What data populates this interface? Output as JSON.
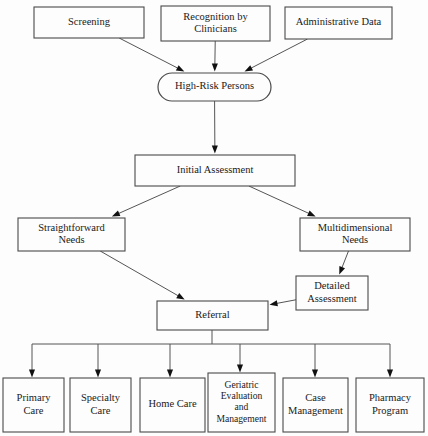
{
  "chart_data": {
    "type": "diagram",
    "diagram_type": "flowchart",
    "orientation": "top-to-bottom",
    "background_color": "#fdfdfd",
    "line_color": "#555555",
    "text_color": "#1a1a1a",
    "nodes": [
      {
        "id": "screening",
        "label": "Screening",
        "shape": "rect",
        "level": 1,
        "x": 34,
        "y": 7,
        "w": 110,
        "h": 31,
        "lines": [
          "Screening"
        ]
      },
      {
        "id": "recognition",
        "label": "Recognition by Clinicians",
        "shape": "rect",
        "level": 1,
        "x": 161,
        "y": 6,
        "w": 109,
        "h": 35,
        "lines": [
          "Recognition by",
          "Clinicians"
        ]
      },
      {
        "id": "admin_data",
        "label": "Administrative Data",
        "shape": "rect",
        "level": 1,
        "x": 285,
        "y": 7,
        "w": 107,
        "h": 32,
        "lines": [
          "Administrative Data"
        ]
      },
      {
        "id": "high_risk",
        "label": "High-Risk Persons",
        "shape": "stadium",
        "level": 2,
        "x": 158,
        "y": 73,
        "w": 113,
        "h": 28,
        "lines": [
          "High-Risk Persons"
        ]
      },
      {
        "id": "initial_assessment",
        "label": "Initial Assessment",
        "shape": "rect",
        "level": 3,
        "x": 135,
        "y": 155,
        "w": 160,
        "h": 31,
        "lines": [
          "Initial Assessment"
        ]
      },
      {
        "id": "straightforward",
        "label": "Straightforward Needs",
        "shape": "rect",
        "level": 4,
        "x": 18,
        "y": 218,
        "w": 107,
        "h": 33,
        "lines": [
          "Straightforward",
          "Needs"
        ]
      },
      {
        "id": "multidimensional",
        "label": "Multidimensional Needs",
        "shape": "rect",
        "level": 4,
        "x": 300,
        "y": 218,
        "w": 110,
        "h": 33,
        "lines": [
          "Multidimensional",
          "Needs"
        ]
      },
      {
        "id": "detailed_assessment",
        "label": "Detailed Assessment",
        "shape": "rect",
        "level": 5,
        "x": 296,
        "y": 276,
        "w": 72,
        "h": 34,
        "lines": [
          "Detailed",
          "Assessment"
        ]
      },
      {
        "id": "referral",
        "label": "Referral",
        "shape": "rect",
        "level": 6,
        "x": 157,
        "y": 301,
        "w": 111,
        "h": 29,
        "lines": [
          "Referral"
        ]
      },
      {
        "id": "primary_care",
        "label": "Primary Care",
        "shape": "rect",
        "level": 7,
        "x": 3,
        "y": 378,
        "w": 61,
        "h": 54,
        "lines": [
          "Primary",
          "Care"
        ]
      },
      {
        "id": "specialty_care",
        "label": "Specialty Care",
        "shape": "rect",
        "level": 7,
        "x": 70,
        "y": 378,
        "w": 61,
        "h": 54,
        "lines": [
          "Specialty",
          "Care"
        ]
      },
      {
        "id": "home_care",
        "label": "Home Care",
        "shape": "rect",
        "level": 7,
        "x": 140,
        "y": 378,
        "w": 65,
        "h": 54,
        "lines": [
          "Home Care"
        ]
      },
      {
        "id": "geriatric",
        "label": "Geriatric Evaluation and Management",
        "shape": "rect",
        "level": 7,
        "x": 208,
        "y": 373,
        "w": 67,
        "h": 59,
        "lines": [
          "Geriatric",
          "Evaluation",
          "and",
          "Management"
        ]
      },
      {
        "id": "case_management",
        "label": "Case Management",
        "shape": "rect",
        "level": 7,
        "x": 283,
        "y": 378,
        "w": 65,
        "h": 54,
        "lines": [
          "Case",
          "Management"
        ]
      },
      {
        "id": "pharmacy",
        "label": "Pharmacy Program",
        "shape": "rect",
        "level": 7,
        "x": 356,
        "y": 378,
        "w": 68,
        "h": 54,
        "lines": [
          "Pharmacy",
          "Program"
        ]
      }
    ],
    "edges": [
      {
        "from": "screening",
        "to": "high_risk",
        "style": "diagonal",
        "arrow": true
      },
      {
        "from": "recognition",
        "to": "high_risk",
        "style": "straight",
        "arrow": true
      },
      {
        "from": "admin_data",
        "to": "high_risk",
        "style": "diagonal",
        "arrow": true
      },
      {
        "from": "high_risk",
        "to": "initial_assessment",
        "style": "straight",
        "arrow": true
      },
      {
        "from": "initial_assessment",
        "to": "straightforward",
        "style": "diagonal",
        "arrow": true
      },
      {
        "from": "initial_assessment",
        "to": "multidimensional",
        "style": "diagonal",
        "arrow": true
      },
      {
        "from": "straightforward",
        "to": "referral",
        "style": "diagonal",
        "arrow": true
      },
      {
        "from": "multidimensional",
        "to": "detailed_assessment",
        "style": "diagonal",
        "arrow": true
      },
      {
        "from": "detailed_assessment",
        "to": "referral",
        "style": "diagonal",
        "arrow": true
      },
      {
        "from": "referral",
        "to": "primary_care",
        "style": "bus",
        "arrow": true
      },
      {
        "from": "referral",
        "to": "specialty_care",
        "style": "bus",
        "arrow": true
      },
      {
        "from": "referral",
        "to": "home_care",
        "style": "bus",
        "arrow": true
      },
      {
        "from": "referral",
        "to": "geriatric",
        "style": "bus",
        "arrow": true
      },
      {
        "from": "referral",
        "to": "case_management",
        "style": "bus",
        "arrow": true
      },
      {
        "from": "referral",
        "to": "pharmacy",
        "style": "bus",
        "arrow": true
      }
    ],
    "bus": {
      "y": 344,
      "x_start": 32,
      "x_end": 390,
      "stem_x": 212,
      "stem_from_y": 330,
      "drops": [
        32,
        98,
        170,
        240,
        315,
        390
      ],
      "drop_end_y": 373
    }
  }
}
